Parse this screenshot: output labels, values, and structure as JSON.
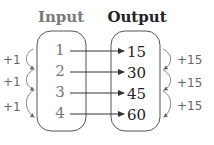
{
  "headers": {
    "input": "Input",
    "output": "Output"
  },
  "inputs": [
    "1",
    "2",
    "3",
    "4"
  ],
  "outputs": [
    "15",
    "30",
    "45",
    "60"
  ],
  "input_steps": [
    "+1",
    "+1",
    "+1"
  ],
  "output_steps": [
    "+15",
    "+15",
    "+15"
  ],
  "colors": {
    "input_header": "#7a7a7a",
    "output_header": "#222222",
    "input_text": "#777777",
    "output_text": "#222222",
    "stroke": "#555555"
  }
}
